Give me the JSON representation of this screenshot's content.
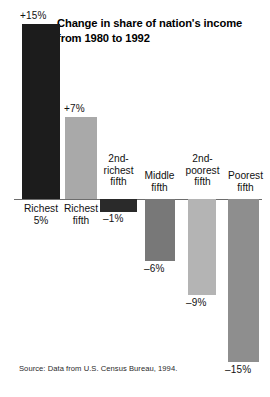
{
  "chart_data": {
    "type": "bar",
    "title": "Change in share of nation's income from 1980 to 1992",
    "xlabel": "",
    "ylabel": "",
    "ylim": [
      -15,
      15
    ],
    "grid": false,
    "legend": null,
    "zero_line": true,
    "source": "Source: Data from U.S. Census Bureau, 1994.",
    "categories": [
      "Richest\n5%",
      "Richest\nfifth",
      "2nd-\nrichest\nfifth",
      "Middle\nfifth",
      "2nd-\npoorest\nfifth",
      "Poorest\nfifth"
    ],
    "values": [
      15,
      7,
      -1,
      -6,
      -9,
      -15
    ],
    "value_labels": [
      "+15%",
      "+7%",
      "–1%",
      "–6%",
      "–9%",
      "–15%"
    ],
    "bar_colors": [
      "#1c1c1c",
      "#a9a9a9",
      "#2a2a2a",
      "#787878",
      "#b4b4b4",
      "#8e8e8e"
    ]
  },
  "bars": [
    {
      "name": "richest-5",
      "label": "Richest\n5%",
      "value_label": "+15%",
      "color": "#1c1c1c",
      "x": 22,
      "w": 38,
      "bar_top": 24,
      "bar_bottom": 199,
      "vl_x": 20,
      "vl_y": 10,
      "cl_x": 14,
      "cl_y": 203,
      "cl_w": 54
    },
    {
      "name": "richest-fifth",
      "label": "Richest\nfifth",
      "value_label": "+7%",
      "color": "#a9a9a9",
      "x": 65,
      "w": 32,
      "bar_top": 117,
      "bar_bottom": 199,
      "vl_x": 64,
      "vl_y": 103,
      "cl_x": 54,
      "cl_y": 203,
      "cl_w": 54
    },
    {
      "name": "second-richest-fifth",
      "label": "2nd-\nrichest\nfifth",
      "value_label": "–1%",
      "color": "#2a2a2a",
      "x": 100,
      "w": 37,
      "bar_top": 199,
      "bar_bottom": 212,
      "vl_x": 103,
      "vl_y": 213,
      "cl_x": 93,
      "cl_y": 153,
      "cl_w": 51
    },
    {
      "name": "middle-fifth",
      "label": "Middle\nfifth",
      "value_label": "–6%",
      "color": "#787878",
      "x": 145,
      "w": 30,
      "bar_top": 199,
      "bar_bottom": 261,
      "vl_x": 144,
      "vl_y": 263,
      "cl_x": 134,
      "cl_y": 170,
      "cl_w": 51
    },
    {
      "name": "second-poorest-fifth",
      "label": "2nd-\npoorest\nfifth",
      "value_label": "–9%",
      "color": "#b4b4b4",
      "x": 188,
      "w": 28,
      "bar_top": 199,
      "bar_bottom": 295,
      "vl_x": 186,
      "vl_y": 297,
      "cl_x": 177,
      "cl_y": 153,
      "cl_w": 51
    },
    {
      "name": "poorest-fifth",
      "label": "Poorest\nfifth",
      "value_label": "–15%",
      "color": "#8e8e8e",
      "x": 228,
      "w": 31,
      "bar_top": 199,
      "bar_bottom": 362,
      "vl_x": 225,
      "vl_y": 364,
      "cl_x": 221,
      "cl_y": 170,
      "cl_w": 49
    }
  ]
}
